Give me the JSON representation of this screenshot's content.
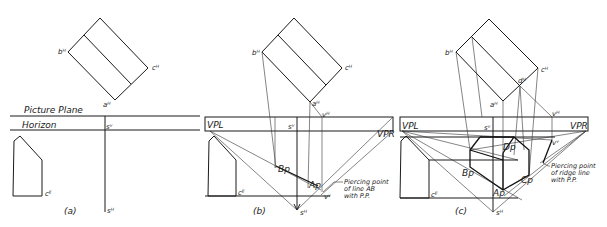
{
  "figure": {
    "panels": [
      {
        "id": "a",
        "caption": "(a)",
        "labels": {
          "b_h": "bᴴ",
          "c_h": "cᴴ",
          "a_h": "aᴴ",
          "s_v": "sᵛ",
          "s_h": "sᴴ",
          "c_e": "cᴱ",
          "picture_plane": "Picture Plane",
          "horizon": "Horizon"
        }
      },
      {
        "id": "b",
        "caption": "(b)",
        "labels": {
          "b_h": "bᴴ",
          "c_h": "cᴴ",
          "a_h": "aᴴ",
          "v_h": "vᴴ",
          "s_v": "sᵛ",
          "s_h": "sᴴ",
          "v_v": "vᵛ",
          "c_e": "cᴱ",
          "vpl": "VPL",
          "vpr": "VPR",
          "bp": "Bp",
          "ap": "Ap"
        },
        "note": [
          "Piercing point",
          "of line AB",
          "with P.P."
        ]
      },
      {
        "id": "c",
        "caption": "(c)",
        "labels": {
          "b_h": "bᴴ",
          "c_h": "cᴴ",
          "a_h": "aᴴ",
          "d_h": "dᴴ",
          "v_h": "vᴴ",
          "s_v": "sᵛ",
          "s_h": "sᴴ",
          "v_v": "vᵛ",
          "c_e": "cᴱ",
          "vpl": "VPL",
          "vpr": "VPR",
          "bp": "Bp",
          "ap": "Ap",
          "cp": "Cp",
          "dp": "Dp"
        },
        "note": [
          "Piercing point",
          "of ridge line",
          "with P.P."
        ]
      }
    ]
  }
}
